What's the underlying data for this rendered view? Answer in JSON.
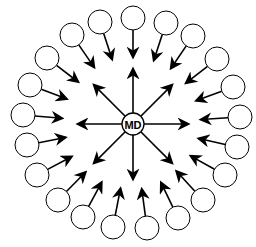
{
  "diagram": {
    "type": "hub-and-spoke",
    "center": {
      "label": "MD",
      "x": 133,
      "y": 124,
      "r": 11,
      "outgoing_arrows": 8,
      "arrow_length": 44
    },
    "outer_nodes": {
      "count": 21,
      "r": 12,
      "label": "",
      "arrow_direction": "inward toward center",
      "positions": [
        [
          100,
          22
        ],
        [
          133,
          18
        ],
        [
          166,
          23
        ],
        [
          193,
          36
        ],
        [
          217,
          59
        ],
        [
          233,
          87
        ],
        [
          240,
          117
        ],
        [
          237,
          147
        ],
        [
          225,
          175
        ],
        [
          203,
          200
        ],
        [
          178,
          218
        ],
        [
          147,
          228
        ],
        [
          113,
          227
        ],
        [
          83,
          217
        ],
        [
          58,
          200
        ],
        [
          37,
          175
        ],
        [
          27,
          145
        ],
        [
          23,
          115
        ],
        [
          30,
          85
        ],
        [
          47,
          58
        ],
        [
          72,
          35
        ]
      ]
    },
    "colors": {
      "stroke": "#000000",
      "fill": "#ffffff",
      "background": "#ffffff"
    }
  }
}
